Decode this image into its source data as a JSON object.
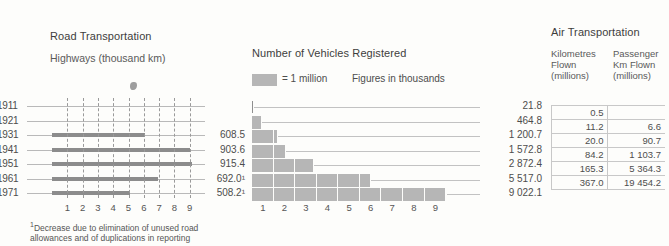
{
  "road": {
    "title": "Road Transportation",
    "subtitle": "Highways (thousand km)",
    "footnote_marker": "1",
    "footnote": "Decrease due to elimination of  unused road allowances and of duplications in reporting",
    "axis_ticks": [
      "1",
      "2",
      "3",
      "4",
      "5",
      "6",
      "7",
      "8",
      "9"
    ],
    "rows": [
      {
        "year": "1911",
        "value": "",
        "bar": 0
      },
      {
        "year": "1921",
        "value": "",
        "bar": 0
      },
      {
        "year": "1931",
        "value": "608.5",
        "bar": 608.5
      },
      {
        "year": "1941",
        "value": "903.6",
        "bar": 903.6
      },
      {
        "year": "1951",
        "value": "915.4",
        "bar": 915.4
      },
      {
        "year": "1961",
        "value": "692.0¹",
        "bar": 692.0
      },
      {
        "year": "1971",
        "value": "508.2¹",
        "bar": 508.2
      }
    ]
  },
  "vehicles": {
    "title": "Number of Vehicles Registered",
    "legend_equals": "= 1 million",
    "legend_note": "Figures in thousands",
    "axis_ticks": [
      "1",
      "2",
      "3",
      "4",
      "5",
      "6",
      "7",
      "8",
      "9"
    ],
    "rows": [
      {
        "value": "21.8",
        "amount": 21.8
      },
      {
        "value": "464.8",
        "amount": 464.8
      },
      {
        "value": "1 200.7",
        "amount": 1200.7
      },
      {
        "value": "1 572.8",
        "amount": 1572.8
      },
      {
        "value": "2 872.4",
        "amount": 2872.4
      },
      {
        "value": "5 517.0",
        "amount": 5517.0
      },
      {
        "value": "9 022.1",
        "amount": 9022.1
      }
    ]
  },
  "air": {
    "title": "Air Transportation",
    "col1_header": "Kilometres Flown (millions)",
    "col2_header": "Passenger Km Flown (millions)",
    "rows": [
      {
        "km_flown": "0.5",
        "passenger_km": ""
      },
      {
        "km_flown": "11.2",
        "passenger_km": "6.6"
      },
      {
        "km_flown": "20.0",
        "passenger_km": "90.7"
      },
      {
        "km_flown": "84.2",
        "passenger_km": "1 103.7"
      },
      {
        "km_flown": "165.3",
        "passenger_km": "5 364.3"
      },
      {
        "km_flown": "367.0",
        "passenger_km": "19 454.2"
      }
    ]
  },
  "chart_data": [
    {
      "type": "bar",
      "orientation": "horizontal",
      "title": "Road Transportation",
      "subtitle": "Highways (thousand km)",
      "categories": [
        "1911",
        "1921",
        "1931",
        "1941",
        "1951",
        "1961",
        "1971"
      ],
      "values": [
        null,
        null,
        608.5,
        903.6,
        915.4,
        692.0,
        508.2
      ],
      "xlabel": "",
      "ylabel": "",
      "xlim": [
        0,
        1000
      ],
      "xticks": [
        100,
        200,
        300,
        400,
        500,
        600,
        700,
        800,
        900
      ],
      "xticklabels": [
        "1",
        "2",
        "3",
        "4",
        "5",
        "6",
        "7",
        "8",
        "9"
      ],
      "tick_unit": "hundred thousand km",
      "grid": true,
      "legend": false,
      "annotations": [
        "¹Decrease due to elimination of  unused road allowances and of duplications in reporting"
      ]
    },
    {
      "type": "bar",
      "orientation": "horizontal",
      "title": "Number of Vehicles Registered",
      "subtitle": "Figures in thousands",
      "categories": [
        "1911",
        "1921",
        "1931",
        "1941",
        "1951",
        "1961",
        "1971"
      ],
      "values": [
        21.8,
        464.8,
        1200.7,
        1572.8,
        2872.4,
        5517.0,
        9022.1
      ],
      "xlabel": "",
      "ylabel": "",
      "xlim": [
        0,
        9500
      ],
      "xticks": [
        1000,
        2000,
        3000,
        4000,
        5000,
        6000,
        7000,
        8000,
        9000
      ],
      "xticklabels": [
        "1",
        "2",
        "3",
        "4",
        "5",
        "6",
        "7",
        "8",
        "9"
      ],
      "unit_block": "1 million",
      "grid": false,
      "legend": true,
      "legend_position": "top-left"
    },
    {
      "type": "table",
      "title": "Air Transportation",
      "columns": [
        "Kilometres Flown (millions)",
        "Passenger Km Flown (millions)"
      ],
      "rows": [
        [
          "0.5",
          ""
        ],
        [
          "11.2",
          "6.6"
        ],
        [
          "20.0",
          "90.7"
        ],
        [
          "84.2",
          "1 103.7"
        ],
        [
          "165.3",
          "5 364.3"
        ],
        [
          "367.0",
          "19 454.2"
        ]
      ]
    }
  ]
}
